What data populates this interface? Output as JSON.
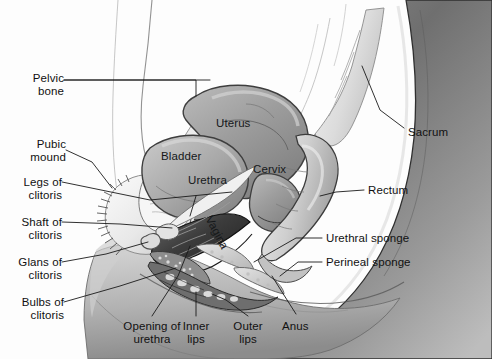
{
  "figure": {
    "style": "grayscale medical illustration",
    "background_color": "#fdfdfd",
    "text_color": "#111111",
    "leader_line_color": "#1a1a1a"
  },
  "labels": {
    "pelvic_bone": "Pelvic\nbone",
    "pubic_mound": "Pubic\nmound",
    "legs_of_clitoris": "Legs of\nclitoris",
    "shaft_of_clitoris": "Shaft of\nclitoris",
    "glans_of_clitoris": "Glans of\nclitoris",
    "bulbs_of_clitoris": "Bulbs of\nclitoris",
    "opening_of_urethra": "Opening of\nurethra",
    "inner_lips": "Inner\nlips",
    "outer_lips": "Outer\nlips",
    "anus": "Anus",
    "sacrum": "Sacrum",
    "rectum": "Rectum",
    "urethral_sponge": "Urethral sponge",
    "perineal_sponge": "Perineal sponge",
    "uterus": "Uterus",
    "bladder": "Bladder",
    "urethra": "Urethra",
    "cervix": "Cervix",
    "vagina": "Vagina"
  }
}
